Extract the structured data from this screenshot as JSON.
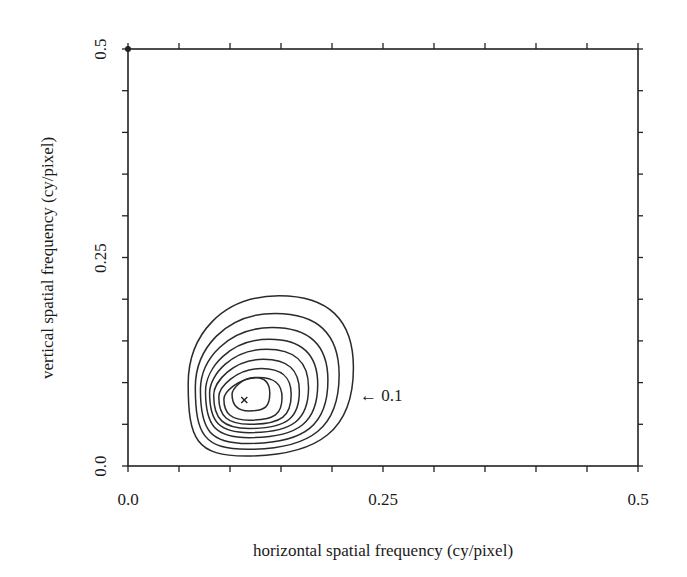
{
  "chart_data": {
    "type": "contour",
    "title": "",
    "xlabel": "horizontal spatial frequency (cy/pixel)",
    "ylabel": "vertical spatial frequency (cy/pixel)",
    "xlim": [
      0.0,
      0.5
    ],
    "ylim": [
      0.0,
      0.5
    ],
    "x_tick_labels": [
      "0.0",
      "0.25",
      "0.5"
    ],
    "y_tick_labels": [
      "0.0",
      "0.25",
      "0.5"
    ],
    "minor_tick_step": 0.05,
    "grid": false,
    "legend": null,
    "peak_marker": {
      "symbol": "x",
      "x": 0.114,
      "y": 0.079
    },
    "contour_count": 9,
    "contours": [
      {
        "level_index": 1,
        "label": "0.1",
        "x_range": [
          0.059,
          0.221
        ],
        "y_range": [
          0.012,
          0.204
        ]
      },
      {
        "level_index": 2,
        "x_range": [
          0.066,
          0.207
        ],
        "y_range": [
          0.02,
          0.183
        ]
      },
      {
        "level_index": 3,
        "x_range": [
          0.071,
          0.196
        ],
        "y_range": [
          0.027,
          0.166
        ]
      },
      {
        "level_index": 4,
        "x_range": [
          0.076,
          0.186
        ],
        "y_range": [
          0.034,
          0.152
        ]
      },
      {
        "level_index": 5,
        "x_range": [
          0.08,
          0.177
        ],
        "y_range": [
          0.04,
          0.14
        ]
      },
      {
        "level_index": 6,
        "x_range": [
          0.084,
          0.168
        ],
        "y_range": [
          0.045,
          0.128
        ]
      },
      {
        "level_index": 7,
        "x_range": [
          0.089,
          0.16
        ],
        "y_range": [
          0.05,
          0.117
        ]
      },
      {
        "level_index": 8,
        "x_range": [
          0.094,
          0.151
        ],
        "y_range": [
          0.055,
          0.106
        ]
      },
      {
        "level_index": 9,
        "x_range": [
          0.102,
          0.139
        ],
        "y_range": [
          0.066,
          0.106
        ]
      }
    ],
    "annotations": [
      {
        "text": "← 0.1",
        "points_to": "outermost contour",
        "x": 0.235,
        "y": 0.085
      }
    ]
  }
}
